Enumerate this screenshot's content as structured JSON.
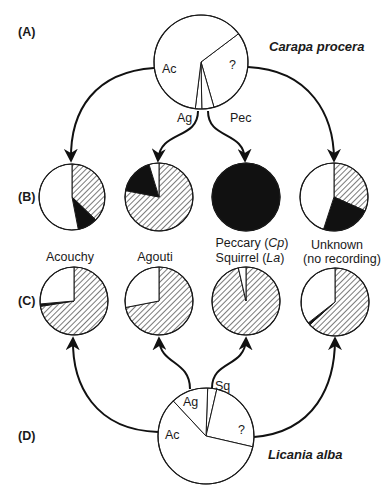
{
  "row_labels": {
    "A": "(A)",
    "B": "(B)",
    "C": "(C)",
    "D": "(D)"
  },
  "species": {
    "top": "Carapa procera",
    "bottom": "Licania alba"
  },
  "captions": {
    "acouchy": "Acouchy",
    "agouti": "Agouti",
    "peccary_line": "Peccary (",
    "peccary_abbr": "Cp",
    "squirrel_line": "Squirrel (",
    "squirrel_abbr": "La",
    "close_paren": ")",
    "unknown": "Unknown",
    "no_recording": "(no recording)"
  },
  "pie_labels": {
    "A": {
      "ac": "Ac",
      "q": "?",
      "ag": "Ag",
      "pec": "Pec"
    },
    "D": {
      "ac": "Ac",
      "ag": "Ag",
      "sq": "Sq",
      "q": "?"
    }
  },
  "colors": {
    "ink": "#1a1a1a",
    "white": "#ffffff",
    "black": "#111111",
    "hatch": "#333333"
  },
  "chart_data": {
    "type": "pie",
    "legend_fills": {
      "white": "white",
      "hatched": "hatched",
      "black": "black"
    },
    "pies": [
      {
        "id": "A",
        "cx": 201,
        "cy": 62,
        "r": 47,
        "label": "Carapa procera removal by",
        "slices": [
          {
            "name": "?",
            "from": 53,
            "to": 164,
            "fill": "white"
          },
          {
            "name": "Pec",
            "from": 164,
            "to": 179,
            "fill": "white"
          },
          {
            "name": "Ag",
            "from": 179,
            "to": 187,
            "fill": "white"
          },
          {
            "name": "Ac",
            "from": 187,
            "to": 413,
            "fill": "white"
          }
        ]
      },
      {
        "id": "B1",
        "cx": 72,
        "cy": 197,
        "r": 33,
        "label": "Acouchy (Cp)",
        "slices": [
          {
            "name": "hatched",
            "from": 0,
            "to": 134,
            "fill": "hatched"
          },
          {
            "name": "black",
            "from": 134,
            "to": 169,
            "fill": "black"
          },
          {
            "name": "white",
            "from": 169,
            "to": 360,
            "fill": "white"
          }
        ]
      },
      {
        "id": "B2",
        "cx": 159,
        "cy": 197,
        "r": 34,
        "label": "Agouti (Cp)",
        "slices": [
          {
            "name": "hatched",
            "from": 0,
            "to": 281,
            "fill": "hatched"
          },
          {
            "name": "black",
            "from": 281,
            "to": 343,
            "fill": "black"
          },
          {
            "name": "white",
            "from": 343,
            "to": 360,
            "fill": "white"
          }
        ]
      },
      {
        "id": "B3",
        "cx": 246,
        "cy": 197,
        "r": 34,
        "label": "Peccary (Cp)",
        "slices": [
          {
            "name": "black",
            "from": 0,
            "to": 360,
            "fill": "black"
          }
        ]
      },
      {
        "id": "B4",
        "cx": 334,
        "cy": 197,
        "r": 34,
        "label": "Unknown (Cp)",
        "slices": [
          {
            "name": "hatched",
            "from": 0,
            "to": 114,
            "fill": "hatched"
          },
          {
            "name": "black",
            "from": 114,
            "to": 198,
            "fill": "black"
          },
          {
            "name": "white",
            "from": 198,
            "to": 360,
            "fill": "white"
          }
        ]
      },
      {
        "id": "C1",
        "cx": 74,
        "cy": 301,
        "r": 34,
        "label": "Acouchy (La)",
        "slices": [
          {
            "name": "hatched",
            "from": 0,
            "to": 261,
            "fill": "hatched"
          },
          {
            "name": "black",
            "from": 261,
            "to": 265,
            "fill": "black"
          },
          {
            "name": "white",
            "from": 265,
            "to": 360,
            "fill": "white"
          }
        ]
      },
      {
        "id": "C2",
        "cx": 159,
        "cy": 301,
        "r": 34,
        "label": "Agouti (La)",
        "slices": [
          {
            "name": "hatched",
            "from": 0,
            "to": 259,
            "fill": "hatched"
          },
          {
            "name": "white",
            "from": 259,
            "to": 360,
            "fill": "white"
          }
        ]
      },
      {
        "id": "C3",
        "cx": 246,
        "cy": 301,
        "r": 34,
        "label": "Squirrel (La)",
        "slices": [
          {
            "name": "hatched",
            "from": 0,
            "to": 347,
            "fill": "hatched"
          },
          {
            "name": "white",
            "from": 347,
            "to": 360,
            "fill": "white"
          }
        ]
      },
      {
        "id": "C4",
        "cx": 335,
        "cy": 302,
        "r": 34,
        "label": "Unknown (La)",
        "slices": [
          {
            "name": "hatched",
            "from": 0,
            "to": 228,
            "fill": "hatched"
          },
          {
            "name": "black",
            "from": 228,
            "to": 232,
            "fill": "black"
          },
          {
            "name": "white",
            "from": 232,
            "to": 360,
            "fill": "white"
          }
        ]
      },
      {
        "id": "D",
        "cx": 206,
        "cy": 436,
        "r": 48,
        "label": "Licania alba removal by",
        "slices": [
          {
            "name": "Sq",
            "from": 2,
            "to": 13,
            "fill": "white"
          },
          {
            "name": "?",
            "from": 13,
            "to": 103,
            "fill": "white"
          },
          {
            "name": "Ac",
            "from": 103,
            "to": 317,
            "fill": "white"
          },
          {
            "name": "Ag",
            "from": 317,
            "to": 362,
            "fill": "white"
          }
        ]
      }
    ]
  }
}
